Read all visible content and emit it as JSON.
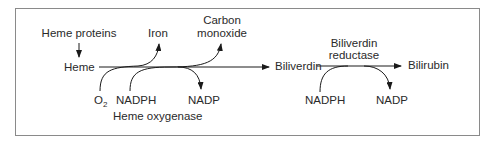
{
  "diagram": {
    "nodes": {
      "heme_proteins": "Heme proteins",
      "heme": "Heme",
      "iron": "Iron",
      "carbon_monoxide_line1": "Carbon",
      "carbon_monoxide_line2": "monoxide",
      "biliverdin": "Biliverdin",
      "bilirubin": "Bilirubin"
    },
    "step1": {
      "enzyme": "Heme oxygenase",
      "o2_base": "O",
      "o2_sub": "2",
      "cofactor_in": "NADPH",
      "cofactor_out": "NADP"
    },
    "step2": {
      "enzyme_line1": "Biliverdin",
      "enzyme_line2": "reductase",
      "cofactor_in": "NADPH",
      "cofactor_out": "NADP"
    },
    "edges": [
      {
        "from": "Heme proteins",
        "to": "Heme"
      },
      {
        "from": "Heme",
        "to": "Biliverdin",
        "enzyme": "Heme oxygenase",
        "inputs": [
          "O2",
          "NADPH"
        ],
        "outputs": [
          "Iron",
          "Carbon monoxide",
          "NADP"
        ]
      },
      {
        "from": "Biliverdin",
        "to": "Bilirubin",
        "enzyme": "Biliverdin reductase",
        "inputs": [
          "NADPH"
        ],
        "outputs": [
          "NADP"
        ]
      }
    ]
  }
}
